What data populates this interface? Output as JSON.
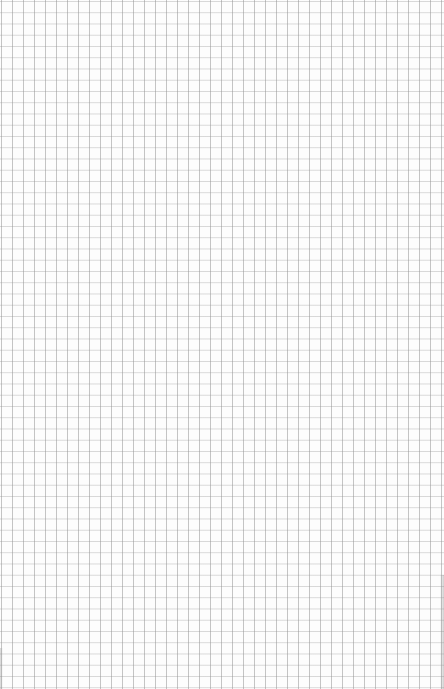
{
  "page": {
    "description": "Blank sheet of graph paper with a uniform square grid",
    "background_color": "#fdfdfd",
    "grid_line_color": "#aaaaaa",
    "grid_spacing_px": 11,
    "columns_approx": 40,
    "rows_approx": 61
  }
}
